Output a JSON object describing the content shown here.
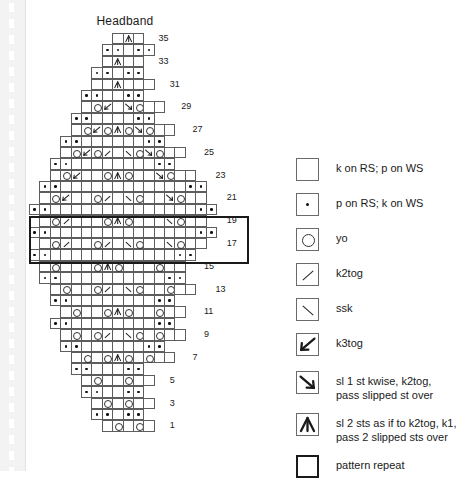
{
  "page_title": "Headband",
  "chart_data": {
    "type": "table",
    "title": "Headband",
    "columns": 19,
    "rows_total": 35,
    "row_numbers_shown": [
      1,
      3,
      5,
      7,
      9,
      11,
      13,
      15,
      17,
      19,
      21,
      23,
      25,
      27,
      29,
      31,
      33,
      35
    ],
    "symbols": {
      "blank": "k on RS; p on WS",
      "purl": "p on RS; k on WS",
      "yo": "yo",
      "k2tog": "k2tog",
      "ssk": "ssk",
      "k3tog": "k3tog",
      "sk2p": "sl 1 st kwise, k2tog, pass slipped st over",
      "cdd": "sl 2 sts as if to k2tog, k1, pass 2 slipped sts over"
    },
    "pattern_repeat": {
      "rows": [
        17,
        18,
        19,
        20
      ],
      "note": "heavy box outlines rows 17-20 across full width"
    },
    "grid": [
      {
        "row": 1,
        "label": "1",
        "offset": 7,
        "cells": [
          "blank",
          "yo",
          "blank",
          "yo",
          "blank"
        ]
      },
      {
        "row": 2,
        "label": "",
        "offset": 6,
        "cells": [
          "purl",
          "purl",
          "blank",
          "purl",
          "purl"
        ]
      },
      {
        "row": 3,
        "label": "3",
        "offset": 6,
        "cells": [
          "blank",
          "yo",
          "blank",
          "yo",
          "blank",
          "blank"
        ]
      },
      {
        "row": 4,
        "label": "",
        "offset": 5,
        "cells": [
          "purl",
          "purl",
          "blank",
          "blank",
          "purl",
          "purl"
        ]
      },
      {
        "row": 5,
        "label": "5",
        "offset": 5,
        "cells": [
          "blank",
          "yo",
          "blank",
          "blank",
          "yo",
          "blank",
          "blank"
        ]
      },
      {
        "row": 6,
        "label": "",
        "offset": 4,
        "cells": [
          "purl",
          "purl",
          "blank",
          "blank",
          "blank",
          "purl",
          "purl"
        ]
      },
      {
        "row": 7,
        "label": "7",
        "offset": 4,
        "cells": [
          "blank",
          "yo",
          "blank",
          "yo",
          "cdd",
          "yo",
          "blank",
          "yo",
          "blank",
          "blank"
        ]
      },
      {
        "row": 8,
        "label": "",
        "offset": 3,
        "cells": [
          "purl",
          "purl",
          "blank",
          "blank",
          "blank",
          "blank",
          "blank",
          "blank",
          "purl",
          "purl"
        ]
      },
      {
        "row": 9,
        "label": "9",
        "offset": 3,
        "cells": [
          "blank",
          "yo",
          "blank",
          "yo",
          "k2tog",
          "blank",
          "ssk",
          "yo",
          "blank",
          "yo",
          "blank",
          "blank"
        ]
      },
      {
        "row": 10,
        "label": "",
        "offset": 2,
        "cells": [
          "purl",
          "purl",
          "blank",
          "blank",
          "blank",
          "blank",
          "blank",
          "blank",
          "blank",
          "blank",
          "purl",
          "purl"
        ]
      },
      {
        "row": 11,
        "label": "11",
        "offset": 3,
        "cells": [
          "blank",
          "yo",
          "blank",
          "blank",
          "yo",
          "cdd",
          "yo",
          "blank",
          "blank",
          "yo",
          "blank",
          "blank"
        ]
      },
      {
        "row": 12,
        "label": "",
        "offset": 2,
        "cells": [
          "purl",
          "purl",
          "blank",
          "blank",
          "blank",
          "blank",
          "blank",
          "blank",
          "blank",
          "blank",
          "purl",
          "purl"
        ]
      },
      {
        "row": 13,
        "label": "13",
        "offset": 2,
        "cells": [
          "blank",
          "yo",
          "blank",
          "blank",
          "yo",
          "k2tog",
          "blank",
          "ssk",
          "yo",
          "blank",
          "blank",
          "yo",
          "blank",
          "blank"
        ]
      },
      {
        "row": 14,
        "label": "",
        "offset": 1,
        "cells": [
          "purl",
          "purl",
          "blank",
          "blank",
          "blank",
          "blank",
          "blank",
          "blank",
          "blank",
          "blank",
          "blank",
          "blank",
          "purl",
          "purl"
        ]
      },
      {
        "row": 15,
        "label": "15",
        "offset": 1,
        "cells": [
          "blank",
          "yo",
          "blank",
          "blank",
          "blank",
          "yo",
          "cdd",
          "yo",
          "blank",
          "blank",
          "blank",
          "yo",
          "blank",
          "blank"
        ]
      },
      {
        "row": 16,
        "label": "",
        "offset": 0,
        "cells": [
          "purl",
          "purl",
          "blank",
          "blank",
          "blank",
          "blank",
          "blank",
          "blank",
          "blank",
          "blank",
          "blank",
          "blank",
          "blank",
          "blank",
          "purl",
          "purl"
        ]
      },
      {
        "row": 17,
        "label": "17",
        "offset": 1,
        "cells": [
          "blank",
          "yo",
          "k2tog",
          "blank",
          "blank",
          "yo",
          "k2tog",
          "blank",
          "ssk",
          "yo",
          "blank",
          "blank",
          "ssk",
          "yo",
          "blank",
          "blank"
        ]
      },
      {
        "row": 18,
        "label": "",
        "offset": 0,
        "cells": [
          "purl",
          "purl",
          "blank",
          "blank",
          "blank",
          "blank",
          "blank",
          "blank",
          "blank",
          "blank",
          "blank",
          "blank",
          "blank",
          "blank",
          "blank",
          "blank",
          "purl",
          "purl"
        ]
      },
      {
        "row": 19,
        "label": "19",
        "offset": 1,
        "cells": [
          "blank",
          "yo",
          "k2tog",
          "blank",
          "blank",
          "blank",
          "yo",
          "cdd",
          "yo",
          "blank",
          "blank",
          "blank",
          "ssk",
          "yo",
          "blank",
          "blank"
        ]
      },
      {
        "row": 20,
        "label": "",
        "offset": 0,
        "cells": [
          "purl",
          "purl",
          "blank",
          "blank",
          "blank",
          "blank",
          "blank",
          "blank",
          "blank",
          "blank",
          "blank",
          "blank",
          "blank",
          "blank",
          "blank",
          "blank",
          "purl",
          "purl"
        ]
      },
      {
        "row": 21,
        "label": "21",
        "offset": 1,
        "cells": [
          "blank",
          "yo",
          "k3tog",
          "blank",
          "blank",
          "yo",
          "k2tog",
          "blank",
          "ssk",
          "yo",
          "blank",
          "blank",
          "sk2p",
          "yo",
          "blank",
          "blank"
        ]
      },
      {
        "row": 22,
        "label": "",
        "offset": 1,
        "cells": [
          "purl",
          "purl",
          "blank",
          "blank",
          "blank",
          "blank",
          "blank",
          "blank",
          "blank",
          "blank",
          "blank",
          "blank",
          "blank",
          "blank",
          "purl",
          "purl"
        ]
      },
      {
        "row": 23,
        "label": "23",
        "offset": 2,
        "cells": [
          "blank",
          "yo",
          "k3tog",
          "blank",
          "blank",
          "yo",
          "cdd",
          "yo",
          "blank",
          "blank",
          "sk2p",
          "yo",
          "blank",
          "blank"
        ]
      },
      {
        "row": 24,
        "label": "",
        "offset": 2,
        "cells": [
          "purl",
          "purl",
          "blank",
          "blank",
          "blank",
          "blank",
          "blank",
          "blank",
          "blank",
          "blank",
          "purl",
          "purl"
        ]
      },
      {
        "row": 25,
        "label": "25",
        "offset": 3,
        "cells": [
          "blank",
          "yo",
          "k3tog",
          "yo",
          "k2tog",
          "blank",
          "ssk",
          "yo",
          "sk2p",
          "yo",
          "blank",
          "blank"
        ]
      },
      {
        "row": 26,
        "label": "",
        "offset": 3,
        "cells": [
          "purl",
          "purl",
          "blank",
          "blank",
          "blank",
          "blank",
          "blank",
          "blank",
          "purl",
          "purl"
        ]
      },
      {
        "row": 27,
        "label": "27",
        "offset": 4,
        "cells": [
          "blank",
          "yo",
          "k3tog",
          "yo",
          "cdd",
          "yo",
          "sk2p",
          "yo",
          "blank",
          "blank"
        ]
      },
      {
        "row": 28,
        "label": "",
        "offset": 4,
        "cells": [
          "purl",
          "purl",
          "blank",
          "blank",
          "blank",
          "blank",
          "purl",
          "purl"
        ]
      },
      {
        "row": 29,
        "label": "29",
        "offset": 5,
        "cells": [
          "blank",
          "yo",
          "k3tog",
          "blank",
          "sk2p",
          "yo",
          "blank",
          "blank"
        ]
      },
      {
        "row": 30,
        "label": "",
        "offset": 5,
        "cells": [
          "purl",
          "purl",
          "blank",
          "blank",
          "purl",
          "purl"
        ]
      },
      {
        "row": 31,
        "label": "31",
        "offset": 6,
        "cells": [
          "blank",
          "blank",
          "cdd",
          "blank",
          "blank",
          "blank"
        ]
      },
      {
        "row": 32,
        "label": "",
        "offset": 6,
        "cells": [
          "purl",
          "purl",
          "blank",
          "purl",
          "purl"
        ]
      },
      {
        "row": 33,
        "label": "33",
        "offset": 7,
        "cells": [
          "blank",
          "cdd",
          "blank",
          "blank"
        ]
      },
      {
        "row": 34,
        "label": "",
        "offset": 7,
        "cells": [
          "purl",
          "purl",
          "blank",
          "purl",
          "purl"
        ]
      },
      {
        "row": 35,
        "label": "35",
        "offset": 8,
        "cells": [
          "blank",
          "cdd",
          "blank"
        ]
      }
    ]
  },
  "legend": {
    "items": [
      {
        "symbol": "blank",
        "label": "k on RS; p on WS",
        "heavy": false
      },
      {
        "symbol": "purl",
        "label": "p on RS; k on WS",
        "heavy": false
      },
      {
        "symbol": "yo",
        "label": "yo",
        "heavy": false
      },
      {
        "symbol": "k2tog",
        "label": "k2tog",
        "heavy": false
      },
      {
        "symbol": "ssk",
        "label": "ssk",
        "heavy": false
      },
      {
        "symbol": "k3tog",
        "label": "k3tog",
        "heavy": false
      },
      {
        "symbol": "sk2p",
        "label": "sl 1 st kwise, k2tog,\npass slipped st over",
        "heavy": false
      },
      {
        "symbol": "cdd",
        "label": "sl 2 sts as if to k2tog, k1,\npass 2 slipped sts over",
        "heavy": false
      },
      {
        "symbol": "repeat",
        "label": "pattern repeat",
        "heavy": true
      }
    ]
  },
  "colors": {
    "grid_line": "#5d5d5d",
    "heavy_line": "#1a1a1a",
    "text": "#1a1a1a",
    "background": "#ffffff",
    "binding": "#f3f3f3"
  }
}
